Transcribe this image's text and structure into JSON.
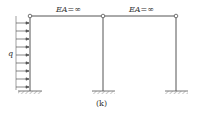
{
  "diagram": {
    "type": "structural-frame",
    "caption": "(k)",
    "load_label": "q",
    "beams": [
      {
        "label": "EA=∞",
        "from": "left-column-top",
        "to": "middle-column-top"
      },
      {
        "label": "EA=∞",
        "from": "middle-column-top",
        "to": "right-column-top"
      }
    ],
    "columns": [
      {
        "name": "left",
        "support": "fixed",
        "top": "hinge"
      },
      {
        "name": "middle",
        "support": "fixed",
        "top": "hinge"
      },
      {
        "name": "right",
        "support": "fixed",
        "top": "hinge"
      }
    ],
    "load": {
      "type": "uniformly-distributed",
      "direction": "horizontal-right",
      "applied_to": "left-column"
    },
    "colors": {
      "line": "#555555",
      "hatch": "#777777"
    }
  }
}
